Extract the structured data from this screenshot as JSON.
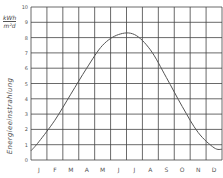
{
  "chart_data": {
    "type": "line",
    "title": "",
    "xlabel": "",
    "ylabel": "Energieeinstrahlung",
    "unit": {
      "numerator": "kWh",
      "denominator": "m²d"
    },
    "categories": [
      "J",
      "F",
      "M",
      "A",
      "M",
      "J",
      "J",
      "A",
      "S",
      "O",
      "N",
      "D"
    ],
    "series": [
      {
        "name": "Energieeinstrahlung",
        "values": [
          1.2,
          2.6,
          4.3,
          6.0,
          7.5,
          8.2,
          8.2,
          7.2,
          5.4,
          3.5,
          1.8,
          0.8
        ]
      }
    ],
    "ylim": [
      0,
      10
    ],
    "yticks": [
      "10",
      "9",
      "8",
      "7",
      "6",
      "5",
      "4",
      "3",
      "2",
      "1",
      "0"
    ],
    "grid": true,
    "legend": "none",
    "line_color": "#555555"
  }
}
